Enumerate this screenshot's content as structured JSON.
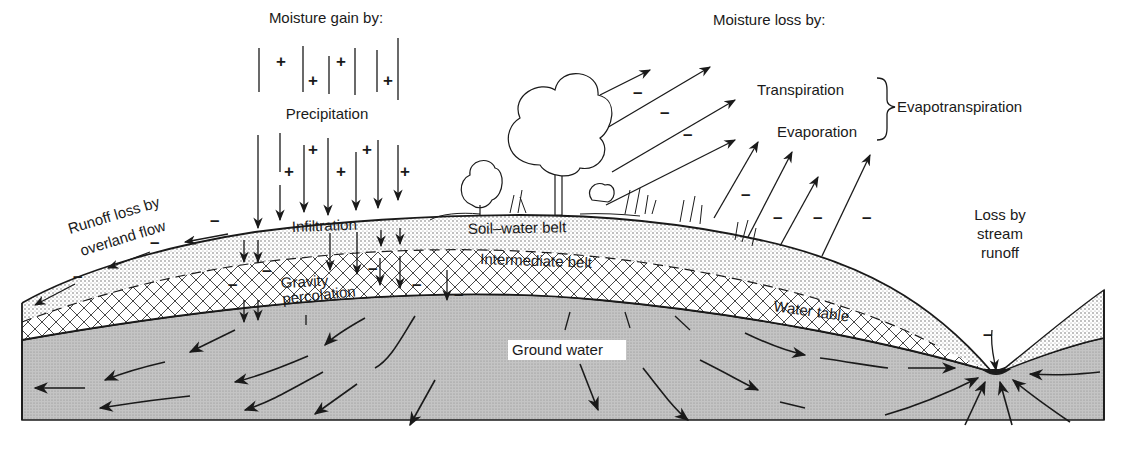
{
  "diagram": {
    "type": "hydrologic cross-section",
    "colors": {
      "ink": "#1a1a1a",
      "background": "#ffffff",
      "soil_stipple": "#d9d9d9",
      "ground_water": "#bdbdbd"
    },
    "labels": {
      "moisture_gain": "Moisture gain by:",
      "precipitation": "Precipitation",
      "moisture_loss": "Moisture loss by:",
      "transpiration": "Transpiration",
      "evaporation": "Evaporation",
      "evapotranspiration": "Evapotranspiration",
      "runoff_line1": "Runoff loss by",
      "runoff_line2": "overland flow",
      "infiltration": "Infiltration",
      "soil_water_belt": "Soil–water belt",
      "intermediate_belt": "Intermediate belt",
      "gravity_line1": "Gravity",
      "gravity_line2": "percolation",
      "water_table": "Water table",
      "ground_water": "Ground water",
      "stream_line1": "Loss by",
      "stream_line2": "stream",
      "stream_line3": "runoff"
    },
    "signs": {
      "plus": "+",
      "minus": "–"
    },
    "zones": [
      "Soil–water belt",
      "Intermediate belt",
      "Ground water"
    ],
    "gains": [
      "Precipitation",
      "Infiltration",
      "Gravity percolation"
    ],
    "losses": [
      "Transpiration",
      "Evaporation",
      "Runoff loss by overland flow",
      "Loss by stream runoff"
    ]
  }
}
